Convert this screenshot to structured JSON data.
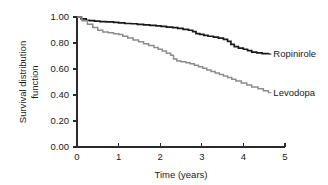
{
  "chart_data": {
    "type": "line",
    "subtype": "kaplan-meier-step",
    "title": "",
    "xlabel": "Time (years)",
    "ylabel_line1": "Survival distribution",
    "ylabel_line2": "function",
    "ylabel": "Survival distribution function",
    "xlim": [
      0,
      5
    ],
    "ylim": [
      0.0,
      1.0
    ],
    "xticks": [
      0,
      1,
      2,
      3,
      4,
      5
    ],
    "xtick_labels": [
      "0",
      "1",
      "2",
      "3",
      "4",
      "5"
    ],
    "yticks": [
      0.0,
      0.2,
      0.4,
      0.6,
      0.8,
      1.0
    ],
    "ytick_labels": [
      "0.00",
      "0.20",
      "0.40",
      "0.60",
      "0.80",
      "1.00"
    ],
    "grid": false,
    "legend_position": "inline-right-of-curve-ends",
    "series": [
      {
        "name": "Ropinirole",
        "color": "#1a1a1a",
        "line_width": 1.7,
        "label_x": 4.72,
        "label_y": 0.715,
        "x": [
          0.0,
          0.1,
          0.22,
          0.3,
          0.42,
          0.55,
          0.7,
          0.88,
          1.0,
          1.15,
          1.3,
          1.45,
          1.6,
          1.75,
          1.9,
          2.02,
          2.15,
          2.3,
          2.42,
          2.55,
          2.68,
          2.78,
          2.86,
          2.95,
          3.05,
          3.15,
          3.28,
          3.4,
          3.52,
          3.62,
          3.7,
          3.78,
          3.88,
          4.0,
          4.1,
          4.2,
          4.32,
          4.45,
          4.6
        ],
        "y": [
          1.0,
          0.985,
          0.975,
          0.972,
          0.968,
          0.965,
          0.962,
          0.958,
          0.955,
          0.95,
          0.948,
          0.944,
          0.94,
          0.936,
          0.932,
          0.928,
          0.922,
          0.918,
          0.912,
          0.905,
          0.898,
          0.888,
          0.872,
          0.866,
          0.858,
          0.852,
          0.845,
          0.838,
          0.828,
          0.812,
          0.79,
          0.772,
          0.76,
          0.752,
          0.742,
          0.73,
          0.724,
          0.718,
          0.715
        ]
      },
      {
        "name": "Levodopa",
        "color": "#8c8c8c",
        "line_width": 1.5,
        "label_x": 4.72,
        "label_y": 0.418,
        "x": [
          0.0,
          0.12,
          0.25,
          0.38,
          0.5,
          0.62,
          0.75,
          0.88,
          1.0,
          1.1,
          1.22,
          1.35,
          1.48,
          1.6,
          1.72,
          1.85,
          1.95,
          2.05,
          2.15,
          2.25,
          2.32,
          2.4,
          2.5,
          2.62,
          2.72,
          2.82,
          2.92,
          3.02,
          3.12,
          3.22,
          3.32,
          3.42,
          3.52,
          3.62,
          3.72,
          3.82,
          3.95,
          4.08,
          4.2,
          4.35,
          4.48,
          4.6
        ],
        "y": [
          1.0,
          0.972,
          0.945,
          0.92,
          0.898,
          0.884,
          0.878,
          0.872,
          0.866,
          0.852,
          0.838,
          0.824,
          0.81,
          0.795,
          0.78,
          0.766,
          0.752,
          0.738,
          0.722,
          0.706,
          0.676,
          0.662,
          0.656,
          0.648,
          0.64,
          0.628,
          0.618,
          0.605,
          0.592,
          0.58,
          0.57,
          0.558,
          0.546,
          0.534,
          0.522,
          0.508,
          0.492,
          0.476,
          0.462,
          0.448,
          0.432,
          0.418
        ]
      }
    ]
  },
  "axes": {
    "x_axis_name": "time-axis",
    "y_axis_name": "survival-axis"
  }
}
